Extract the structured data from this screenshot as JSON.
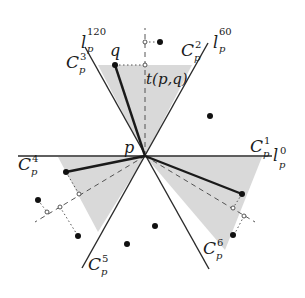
{
  "diagram": {
    "origin_label": "p",
    "point_q_label": "q",
    "projection_label": "t(p,q)",
    "lines": [
      {
        "name": "l",
        "sup": "0",
        "sub": "p"
      },
      {
        "name": "l",
        "sup": "60",
        "sub": "p"
      },
      {
        "name": "l",
        "sup": "120",
        "sub": "p"
      }
    ],
    "cones": [
      {
        "name": "C",
        "sup": "1",
        "sub": "p"
      },
      {
        "name": "C",
        "sup": "2",
        "sub": "p"
      },
      {
        "name": "C",
        "sup": "3",
        "sub": "p"
      },
      {
        "name": "C",
        "sup": "4",
        "sub": "p"
      },
      {
        "name": "C",
        "sup": "5",
        "sub": "p"
      },
      {
        "name": "C",
        "sup": "6",
        "sub": "p"
      }
    ],
    "shaded_cones": [
      "C2/C3 (up)",
      "C4/C5 (lower-left)",
      "C1/C6 (lower-right)"
    ],
    "colors": {
      "shade": "#d9d9d9",
      "line": "#2a2a2a",
      "background": "#ffffff"
    }
  }
}
